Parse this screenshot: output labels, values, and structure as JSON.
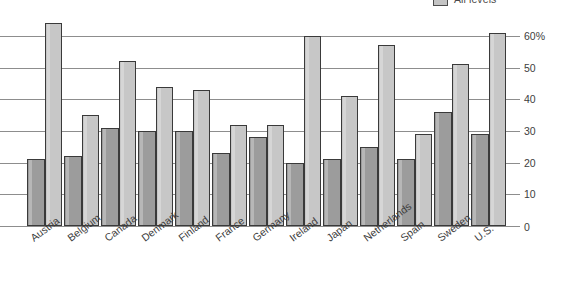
{
  "chart_data": {
    "type": "bar",
    "title": "",
    "subtitle": "",
    "xlabel": "",
    "ylabel": "",
    "ylim": [
      0,
      65
    ],
    "grid": true,
    "legend_position": "top-right",
    "categories": [
      "Austria",
      "Belgium",
      "Canada",
      "Denmark",
      "Finland",
      "France",
      "Germany",
      "Ireland",
      "Japan",
      "Netherlands",
      "Spain",
      "Sweden",
      "U.S."
    ],
    "ytick_labels": [
      "0",
      "10",
      "20",
      "30",
      "40",
      "50",
      "60%"
    ],
    "ytick_values": [
      0,
      10,
      20,
      30,
      40,
      50,
      60
    ],
    "series": [
      {
        "name": "Lower secondary",
        "color": "#9c9c9c",
        "values": [
          21,
          22,
          31,
          30,
          30,
          23,
          28,
          20,
          21,
          25,
          21,
          36,
          29
        ]
      },
      {
        "name": "All levels",
        "color": "#c7c7c7",
        "values": [
          64,
          35,
          52,
          44,
          43,
          32,
          32,
          60,
          41,
          57,
          29,
          51,
          61
        ]
      }
    ]
  },
  "legend": {
    "entries": [
      {
        "label": "All levels",
        "color": "#c7c7c7"
      }
    ]
  },
  "axis": {
    "zero_label": "0",
    "unit_suffix": "%"
  }
}
